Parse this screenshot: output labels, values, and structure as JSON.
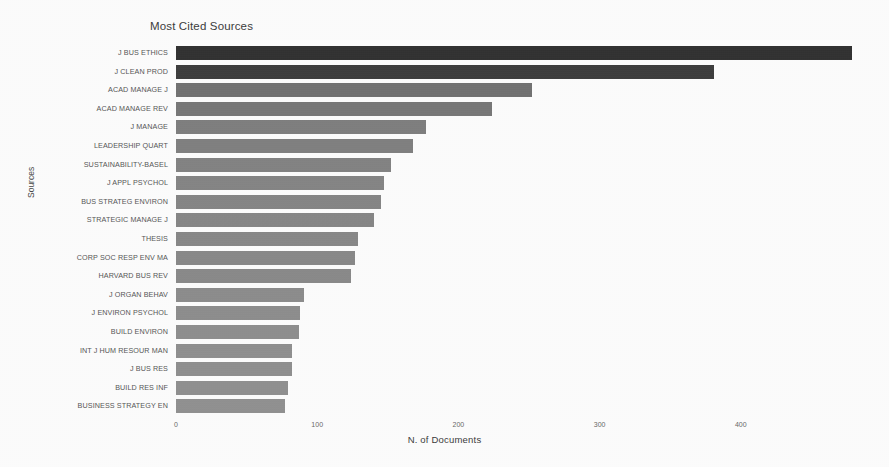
{
  "chart_data": {
    "type": "bar",
    "orientation": "horizontal",
    "title": "Most Cited Sources",
    "xlabel": "N. of Documents",
    "ylabel": "Sources",
    "xlim": [
      0,
      500
    ],
    "xticks": [
      0,
      100,
      200,
      300,
      400
    ],
    "xtick_labels": [
      "0",
      "100",
      "200",
      "300",
      "400"
    ],
    "grid": false,
    "legend": "none",
    "categories": [
      "J BUS ETHICS",
      "J CLEAN PROD",
      "ACAD MANAGE J",
      "ACAD MANAGE REV",
      "J MANAGE",
      "LEADERSHIP QUART",
      "SUSTAINABILITY-BASEL",
      "J APPL PSYCHOL",
      "BUS STRATEG ENVIRON",
      "STRATEGIC MANAGE J",
      "THESIS",
      "CORP SOC RESP ENV MA",
      "HARVARD BUS REV",
      "J ORGAN BEHAV",
      "J ENVIRON PSYCHOL",
      "BUILD ENVIRON",
      "INT J HUM RESOUR MAN",
      "J BUS RES",
      "BUILD RES INF",
      "BUSINESS STRATEGY EN"
    ],
    "values": [
      479,
      381,
      252,
      224,
      177,
      168,
      152,
      147,
      145,
      140,
      129,
      127,
      124,
      91,
      88,
      87,
      82,
      82,
      79,
      77
    ],
    "bar_colors": [
      "#262626",
      "#333333",
      "#6f6f6f",
      "#757575",
      "#7d7d7d",
      "#7f7f7f",
      "#828282",
      "#848484",
      "#858585",
      "#868686",
      "#888888",
      "#898989",
      "#8a8a8a",
      "#8d8d8d",
      "#8e8e8e",
      "#8f8f8f",
      "#909090",
      "#909090",
      "#919191",
      "#929292"
    ]
  },
  "colors": {
    "background": "#ffffff",
    "title_text": "#3d3d3d",
    "tick_text": "#6a6a6a",
    "category_text": "#565656",
    "bar_dark": "#262626",
    "bar_light": "#929292"
  }
}
